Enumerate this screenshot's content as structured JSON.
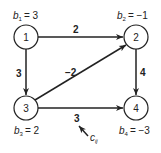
{
  "diagram": {
    "type": "directed network flow graph",
    "colors": {
      "stroke": "#222222",
      "background": "#ffffff"
    },
    "nodes": [
      {
        "id": "1",
        "label": "1",
        "supply_var": "b",
        "supply_sub": "1",
        "supply_value": "= 3",
        "x": 26,
        "y": 37
      },
      {
        "id": "2",
        "label": "2",
        "supply_var": "b",
        "supply_sub": "2",
        "supply_value": "= −1",
        "x": 136,
        "y": 37
      },
      {
        "id": "3",
        "label": "3",
        "supply_var": "b",
        "supply_sub": "3",
        "supply_value": "= 2",
        "x": 26,
        "y": 108
      },
      {
        "id": "4",
        "label": "4",
        "supply_var": "b",
        "supply_sub": "4",
        "supply_value": "= −3",
        "x": 136,
        "y": 108
      }
    ],
    "edges": [
      {
        "from": "1",
        "to": "2",
        "cost": "2"
      },
      {
        "from": "1",
        "to": "3",
        "cost": "3"
      },
      {
        "from": "3",
        "to": "2",
        "cost": "−2"
      },
      {
        "from": "2",
        "to": "4",
        "cost": "4"
      },
      {
        "from": "3",
        "to": "4",
        "cost": "3"
      }
    ],
    "annotation": {
      "var": "c",
      "sub": "ij",
      "points_to_edge": "3->4"
    }
  }
}
